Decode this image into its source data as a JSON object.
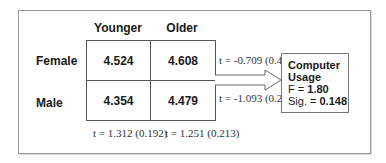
{
  "columns": [
    "Younger",
    "Older"
  ],
  "rows": [
    {
      "label": "Female",
      "values": [
        "4.524",
        "4.608"
      ],
      "t_test": "t = -0.709 (0.480)"
    },
    {
      "label": "Male",
      "values": [
        "4.354",
        "4.479"
      ],
      "t_test": "t = -1.093 (0.276)"
    }
  ],
  "column_t_tests": [
    "t = 1.312 (0.192)",
    "t = 1.251 (0.213)"
  ],
  "outcome": {
    "title_line1": "Computer",
    "title_line2": "Usage",
    "f_label": "F = ",
    "f_value": "1.80",
    "sig_label": "Sig. = ",
    "sig_value": "0.148"
  }
}
